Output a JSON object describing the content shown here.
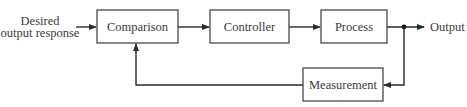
{
  "diagram": {
    "type": "feedback-control-block-diagram",
    "input_label_line1": "Desired",
    "input_label_line2": "output response",
    "output_label": "Output",
    "blocks": [
      {
        "id": "comparison",
        "label": "Comparison"
      },
      {
        "id": "controller",
        "label": "Controller"
      },
      {
        "id": "process",
        "label": "Process"
      },
      {
        "id": "measurement",
        "label": "Measurement"
      }
    ],
    "connections": [
      {
        "from": "input",
        "to": "comparison"
      },
      {
        "from": "comparison",
        "to": "controller"
      },
      {
        "from": "controller",
        "to": "process"
      },
      {
        "from": "process",
        "to": "output"
      },
      {
        "from": "output-junction",
        "to": "measurement"
      },
      {
        "from": "measurement",
        "to": "comparison"
      }
    ],
    "colors": {
      "stroke": "#2a2a2a",
      "text": "#3a3a3a",
      "background": "#ffffff"
    }
  }
}
